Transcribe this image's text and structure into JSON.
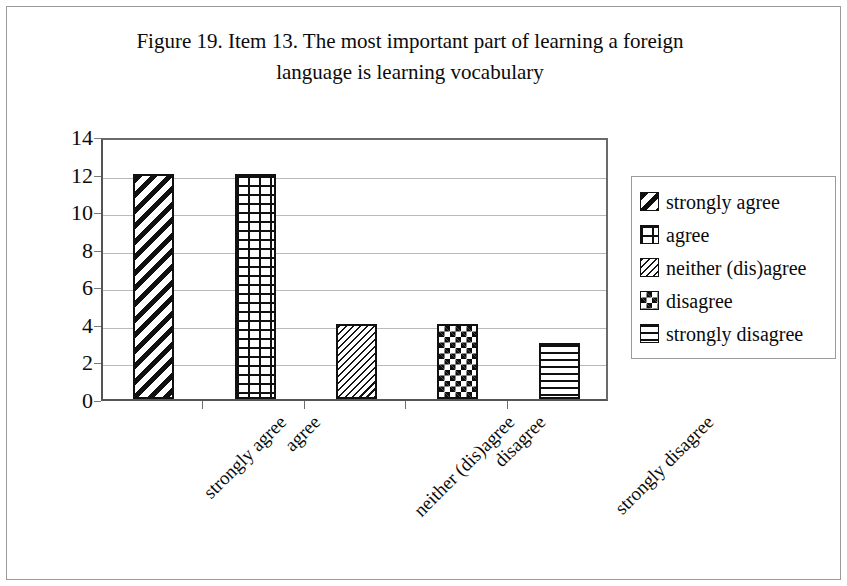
{
  "figure": {
    "title_line1": "Figure 19. Item 13. The most important part of learning a foreign",
    "title_line2": "language is learning vocabulary"
  },
  "chart_data": {
    "type": "bar",
    "title": "Figure 19. Item 13. The most important part of learning a foreign language is learning vocabulary",
    "xlabel": "",
    "ylabel": "",
    "categories": [
      "strongly agree",
      "agree",
      "neither (dis)agree",
      "disagree",
      "strongly disagree"
    ],
    "values": [
      12,
      12,
      4,
      4,
      3
    ],
    "ylim": [
      0,
      14
    ],
    "ytick_step": 2,
    "yticks": [
      0,
      2,
      4,
      6,
      8,
      10,
      12,
      14
    ],
    "ytick_labels": [
      "0",
      "2",
      "4",
      "6",
      "8",
      "10",
      "12",
      "14"
    ],
    "grid": true,
    "grid_axis": "y",
    "legend_position": "right",
    "bar_patterns": [
      "diagonal-stripes",
      "brick",
      "fine-diagonal-hatch",
      "checkerboard",
      "horizontal-stripes"
    ],
    "legend": [
      {
        "label": "strongly agree",
        "pattern": "diagonal-stripes"
      },
      {
        "label": "agree",
        "pattern": "brick"
      },
      {
        "label": "neither (dis)agree",
        "pattern": "fine-diagonal-hatch"
      },
      {
        "label": "disagree",
        "pattern": "checkerboard"
      },
      {
        "label": "strongly disagree",
        "pattern": "horizontal-stripes"
      }
    ],
    "colors": {
      "bar_outline": "#111111",
      "bar_fill": "#ffffff",
      "gridline": "#b9b9b9",
      "axis": "#545454",
      "text": "#0b0b0b",
      "frame": "#9a9a9a"
    }
  }
}
